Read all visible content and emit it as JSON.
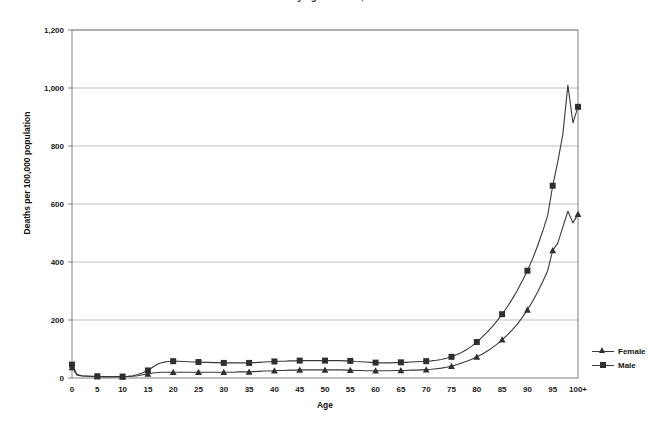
{
  "figure": {
    "title_fragment": "Death rates by age and sex, United States",
    "ylabel": "Deaths per 100,000 population",
    "xlabel": "Age"
  },
  "legend": {
    "position": "right-bottom",
    "entries": [
      {
        "label": "Female",
        "marker": "triangle-marker-icon",
        "color": "#2f2f2f"
      },
      {
        "label": "Male",
        "marker": "square-marker-icon",
        "color": "#2f2f2f"
      }
    ]
  },
  "colors": {
    "line": "#3a3a3a",
    "marker": "#2f2f2f",
    "gridline": "#bdbdbd",
    "axis": "#808080",
    "background": "#ffffff"
  },
  "chart_data": {
    "type": "line",
    "title": "Death rates by age and sex, United States",
    "xlabel": "Age",
    "ylabel": "Deaths per 100,000 population",
    "grid": "horizontal",
    "legend_position": "right",
    "xlim": [
      0,
      100
    ],
    "ylim": [
      0,
      1200
    ],
    "yticks": [
      0,
      200,
      400,
      600,
      800,
      1000,
      1200
    ],
    "ytick_labels": [
      "0",
      "200",
      "400",
      "600",
      "800",
      "1,000",
      "1,200"
    ],
    "xticks": [
      0,
      5,
      10,
      15,
      20,
      25,
      30,
      35,
      40,
      45,
      50,
      55,
      60,
      65,
      70,
      75,
      80,
      85,
      90,
      95,
      100
    ],
    "xtick_labels": [
      "0",
      "5",
      "10",
      "15",
      "20",
      "25",
      "30",
      "35",
      "40",
      "45",
      "50",
      "55",
      "60",
      "65",
      "70",
      "75",
      "80",
      "85",
      "90",
      "95",
      "100+"
    ],
    "x": [
      0,
      1,
      2,
      3,
      4,
      5,
      6,
      7,
      8,
      9,
      10,
      11,
      12,
      13,
      14,
      15,
      16,
      17,
      18,
      19,
      20,
      21,
      22,
      23,
      24,
      25,
      26,
      27,
      28,
      29,
      30,
      31,
      32,
      33,
      34,
      35,
      36,
      37,
      38,
      39,
      40,
      41,
      42,
      43,
      44,
      45,
      46,
      47,
      48,
      49,
      50,
      51,
      52,
      53,
      54,
      55,
      56,
      57,
      58,
      59,
      60,
      61,
      62,
      63,
      64,
      65,
      66,
      67,
      68,
      69,
      70,
      71,
      72,
      73,
      74,
      75,
      76,
      77,
      78,
      79,
      80,
      81,
      82,
      83,
      84,
      85,
      86,
      87,
      88,
      89,
      90,
      91,
      92,
      93,
      94,
      95,
      96,
      97,
      98,
      99,
      100
    ],
    "series": [
      {
        "name": "Male",
        "marker": "square",
        "marker_interval": 5,
        "values": [
          46,
          12,
          8,
          7,
          6,
          6,
          5,
          5,
          5,
          5,
          5,
          6,
          8,
          12,
          18,
          26,
          38,
          48,
          54,
          57,
          58,
          58,
          57,
          56,
          55,
          55,
          54,
          54,
          53,
          53,
          52,
          52,
          52,
          52,
          52,
          52,
          53,
          54,
          55,
          56,
          57,
          58,
          58,
          59,
          59,
          60,
          60,
          60,
          60,
          60,
          60,
          60,
          60,
          60,
          59,
          59,
          57,
          56,
          55,
          54,
          53,
          52,
          52,
          52,
          53,
          54,
          54,
          55,
          56,
          57,
          58,
          59,
          61,
          64,
          68,
          73,
          80,
          88,
          98,
          110,
          124,
          140,
          157,
          176,
          197,
          220,
          245,
          272,
          302,
          335,
          370,
          410,
          455,
          505,
          560,
          663,
          745,
          840,
          1010,
          880,
          935
        ]
      },
      {
        "name": "Female",
        "marker": "triangle",
        "marker_interval": 5,
        "values": [
          36,
          10,
          7,
          6,
          5,
          5,
          4,
          4,
          4,
          4,
          4,
          5,
          6,
          8,
          11,
          14,
          17,
          19,
          20,
          20,
          20,
          20,
          20,
          20,
          20,
          20,
          20,
          20,
          20,
          20,
          20,
          20,
          20,
          21,
          21,
          21,
          22,
          23,
          24,
          24,
          25,
          26,
          26,
          27,
          27,
          28,
          28,
          28,
          28,
          28,
          28,
          28,
          28,
          28,
          27,
          27,
          26,
          26,
          25,
          25,
          25,
          25,
          25,
          25,
          26,
          26,
          26,
          27,
          27,
          28,
          29,
          30,
          32,
          34,
          37,
          41,
          46,
          52,
          58,
          65,
          73,
          82,
          92,
          104,
          117,
          132,
          148,
          166,
          186,
          209,
          235,
          264,
          296,
          331,
          370,
          440,
          465,
          520,
          575,
          535,
          565
        ]
      }
    ]
  }
}
